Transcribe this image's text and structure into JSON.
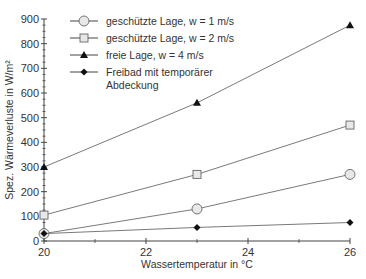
{
  "chart_data": {
    "type": "line",
    "title": "",
    "xlabel": "Wassertemperatur in °C",
    "ylabel": "Spez. Wärmeverluste in W/m²",
    "xlim": [
      20,
      26
    ],
    "ylim": [
      0,
      900
    ],
    "xticks": [
      20,
      22,
      24,
      26
    ],
    "xminor": [
      21,
      23,
      25
    ],
    "yticks": [
      0,
      100,
      200,
      300,
      400,
      500,
      600,
      700,
      800,
      900
    ],
    "grid": false,
    "legend_position": "top-left",
    "series": [
      {
        "name": "geschützte Lage, w = 1 m/s",
        "marker": "circle",
        "x": [
          20,
          23,
          26
        ],
        "y": [
          30,
          130,
          270
        ]
      },
      {
        "name": "geschützte Lage, w = 2 m/s",
        "marker": "square",
        "x": [
          20,
          23,
          26
        ],
        "y": [
          105,
          270,
          470
        ]
      },
      {
        "name": "freie Lage, w = 4 m/s",
        "marker": "triangle",
        "x": [
          20,
          23,
          26
        ],
        "y": [
          300,
          560,
          875
        ]
      },
      {
        "name": "Freibad mit temporärer Abdeckung",
        "marker": "diamond",
        "x": [
          20,
          23,
          26
        ],
        "y": [
          30,
          55,
          75
        ]
      }
    ],
    "legend_lines": [
      [
        "geschützte Lage, w = 1 m/s"
      ],
      [
        "geschützte Lage, w = 2 m/s"
      ],
      [
        "freie Lage, w = 4 m/s"
      ],
      [
        "Freibad mit temporärer",
        "Abdeckung"
      ]
    ],
    "colors": {
      "line": "#7a7a7a",
      "axis": "#444444",
      "marker_fill_open": "#e8e8e8",
      "marker_fill_solid": "#111111"
    }
  }
}
